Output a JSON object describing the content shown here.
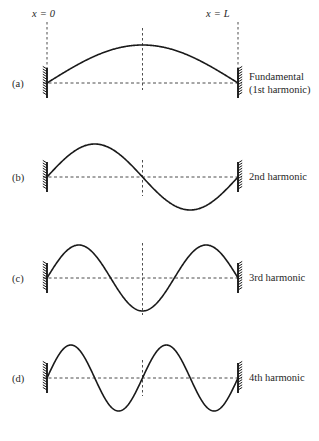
{
  "figure": {
    "axis_labels": {
      "left": "x = 0",
      "right": "x = L"
    },
    "stroke_color": "#1a1a1a",
    "dash_color": "#4d4d4d",
    "background": "#ffffff",
    "geometry": {
      "wall_left_x": 47,
      "wall_right_x": 238,
      "center_x": 142.5,
      "string_length_px": 191
    },
    "panels": [
      {
        "letter": "(a)",
        "letter_x": 12,
        "letter_y": 78,
        "baseline_y": 83,
        "amplitude": 38,
        "harmonic_number": 1,
        "half_wavelengths": 1,
        "nodes": 2,
        "antinodes": 1,
        "caption_lines": [
          "Fundamental",
          "(1st harmonic)"
        ],
        "caption_x": 249,
        "caption_y": 71,
        "center_tick": {
          "y_top": 28,
          "y_bottom": 90
        }
      },
      {
        "letter": "(b)",
        "letter_x": 12,
        "letter_y": 172,
        "baseline_y": 177,
        "amplitude": 33,
        "harmonic_number": 2,
        "half_wavelengths": 2,
        "nodes": 3,
        "antinodes": 2,
        "caption_lines": [
          "2nd harmonic"
        ],
        "caption_x": 249,
        "caption_y": 171,
        "center_tick": {
          "y_top": 160,
          "y_bottom": 196
        }
      },
      {
        "letter": "(c)",
        "letter_x": 12,
        "letter_y": 273,
        "baseline_y": 278,
        "amplitude": 33,
        "harmonic_number": 3,
        "half_wavelengths": 3,
        "nodes": 4,
        "antinodes": 3,
        "caption_lines": [
          "3rd harmonic"
        ],
        "caption_x": 249,
        "caption_y": 272,
        "center_tick": {
          "y_top": 243,
          "y_bottom": 315
        }
      },
      {
        "letter": "(d)",
        "letter_x": 12,
        "letter_y": 373,
        "baseline_y": 378,
        "amplitude": 33,
        "harmonic_number": 4,
        "half_wavelengths": 4,
        "nodes": 5,
        "antinodes": 4,
        "caption_lines": [
          "4th harmonic"
        ],
        "caption_x": 249,
        "caption_y": 372,
        "center_tick": {
          "y_top": 360,
          "y_bottom": 396
        }
      }
    ]
  },
  "chart_data": {
    "type": "line",
    "xlabel": "x",
    "ylabel": "displacement",
    "x": [
      0,
      "L"
    ],
    "xlim": [
      0,
      1
    ],
    "ylim": [
      -1,
      1
    ],
    "grid": false,
    "legend_position": "right",
    "annotations": [
      "x = 0",
      "x = L"
    ],
    "series": [
      {
        "name": "Fundamental (1st harmonic)",
        "harmonic": 1,
        "equation": "y = A sin(1*pi*x/L)",
        "nodes": 2,
        "antinodes": 1,
        "wavelength": "2L"
      },
      {
        "name": "2nd harmonic",
        "harmonic": 2,
        "equation": "y = A sin(2*pi*x/L)",
        "nodes": 3,
        "antinodes": 2,
        "wavelength": "L"
      },
      {
        "name": "3rd harmonic",
        "harmonic": 3,
        "equation": "y = A sin(3*pi*x/L)",
        "nodes": 4,
        "antinodes": 3,
        "wavelength": "2L/3"
      },
      {
        "name": "4th harmonic",
        "harmonic": 4,
        "equation": "y = A sin(4*pi*x/L)",
        "nodes": 5,
        "antinodes": 4,
        "wavelength": "L/2"
      }
    ]
  }
}
